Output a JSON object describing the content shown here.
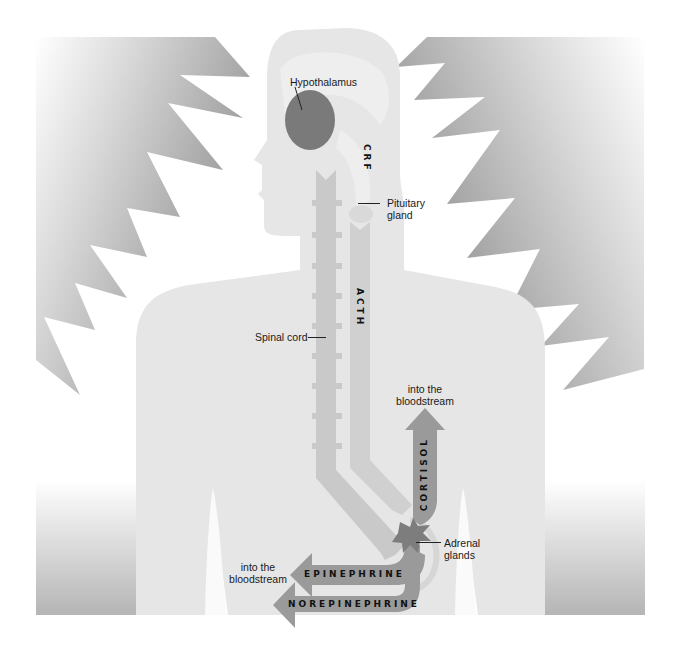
{
  "diagram": {
    "colors": {
      "background": "#ffffff",
      "body": "#e6e6e6",
      "spine": "#c9c9c9",
      "acth_column": "#cfcfcf",
      "hypothalamus": "#7a7a7a",
      "adrenal": "#7d7d7d",
      "hormone_arrow": "#9a9a9a",
      "burst_dark": "#8c8c8c",
      "text": "#1a1a1a"
    },
    "labels": {
      "hypothalamus": "Hypothalamus",
      "crf": "CRF",
      "pituitary_line1": "Pituitary",
      "pituitary_line2": "gland",
      "acth": "ACTH",
      "spinal_cord": "Spinal cord",
      "cortisol_dest_line1": "into the",
      "cortisol_dest_line2": "bloodstream",
      "cortisol": "CORTISOL",
      "adrenal_line1": "Adrenal",
      "adrenal_line2": "glands",
      "epi_dest_line1": "into the",
      "epi_dest_line2": "bloodstream",
      "epinephrine": "EPINEPHRINE",
      "norepinephrine": "NOREPINEPHRINE"
    }
  }
}
